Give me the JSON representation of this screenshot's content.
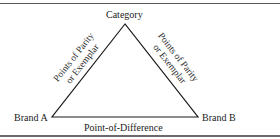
{
  "diagram": {
    "nodes": {
      "top": {
        "label": "Category"
      },
      "left": {
        "label": "Brand A"
      },
      "right": {
        "label": "Brand B"
      }
    },
    "edges": {
      "left": {
        "line1": "Points of Parity",
        "line2": "or Exemplar"
      },
      "right": {
        "line1": "Points of Parity",
        "line2": "or Exemplar"
      },
      "bottom": {
        "label": "Point-of-Difference"
      }
    },
    "colors": {
      "line": "#1a1a1a",
      "text": "#222222",
      "rule": "#5a5a5a"
    }
  }
}
